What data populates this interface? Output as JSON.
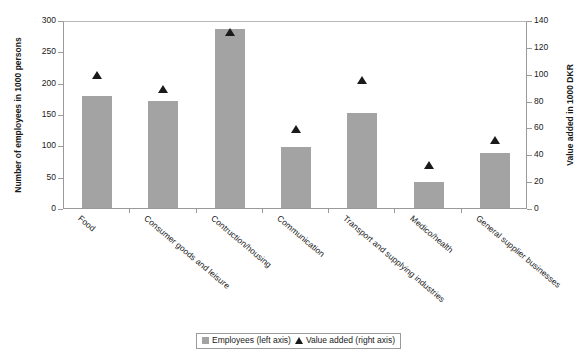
{
  "chart_data": {
    "type": "bar",
    "title": "",
    "subtitle": "",
    "categories": [
      "Food",
      "Consumer goods and leisure",
      "Contruction/housing",
      "Communication",
      "Transport and supplying industries",
      "Medico/health",
      "General supplier businesses"
    ],
    "series": [
      {
        "name": "Employees (left axis)",
        "type": "bar",
        "axis": "left",
        "color": "#a3a3a3",
        "values": [
          178,
          170,
          285,
          98,
          152,
          42,
          87
        ]
      },
      {
        "name": "Value added (right axis)",
        "type": "scatter",
        "marker": "triangle-up",
        "axis": "right",
        "color": "#1a1a1a",
        "values": [
          96,
          86,
          128,
          56,
          92,
          29,
          48
        ]
      }
    ],
    "xlabel": "",
    "ylabel": "Number of employees in 1000 persons",
    "ylabel_right": "Value added in 1000 DKR",
    "ylim": [
      0,
      300
    ],
    "ylim_right": [
      0,
      140
    ],
    "yticks": [
      0,
      50,
      100,
      150,
      200,
      250,
      300
    ],
    "yticks_right": [
      0,
      20,
      40,
      60,
      80,
      100,
      120,
      140
    ],
    "grid": false,
    "legend_position": "bottom-center"
  },
  "axes": {
    "left": {
      "title": "Number of employees in 1000 persons",
      "ticks": [
        "0",
        "50",
        "100",
        "150",
        "200",
        "250",
        "300"
      ]
    },
    "right": {
      "title": "Value added in 1000 DKR",
      "ticks": [
        "0",
        "20",
        "40",
        "60",
        "80",
        "100",
        "120",
        "140"
      ]
    }
  },
  "legend": {
    "items": [
      {
        "label": "Employees (left axis)",
        "marker": "square-swatch"
      },
      {
        "label": "Value added (right axis)",
        "marker": "triangle-up-icon"
      }
    ]
  }
}
